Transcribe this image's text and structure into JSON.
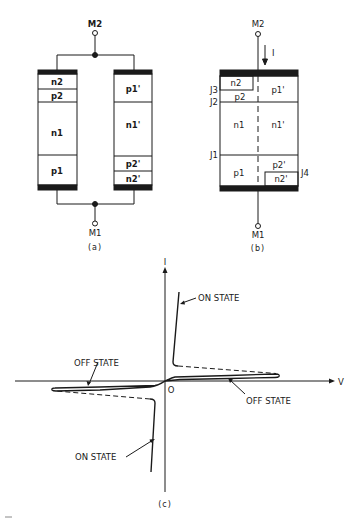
{
  "figure_a": {
    "terminal_top": "M2",
    "terminal_bottom": "M1",
    "caption": "(a)",
    "left_device_layers": [
      "n2",
      "p2",
      "n1",
      "p1"
    ],
    "right_device_layers": [
      "p1'",
      "n1'",
      "p2'",
      "n2'"
    ]
  },
  "figure_b": {
    "terminal_top": "M2",
    "terminal_bottom": "M1",
    "current_label": "I",
    "caption": "(b)",
    "layers_left": [
      "n2",
      "p2",
      "n1",
      "p1"
    ],
    "layers_right": [
      "p1'",
      "n1'",
      "p2'",
      "n2'"
    ],
    "junctions": [
      "J3",
      "J2",
      "J1",
      "J4"
    ]
  },
  "figure_c": {
    "y_axis_label": "I",
    "x_axis_label": "V",
    "origin_label": "O",
    "caption": "(c)",
    "annotations": {
      "on_state_upper": "ON STATE",
      "off_state_left": "OFF STATE",
      "off_state_right": "OFF STATE",
      "on_state_lower": "ON STATE"
    }
  },
  "colors": {
    "ink": "#1a1a1a",
    "background": "#ffffff"
  }
}
